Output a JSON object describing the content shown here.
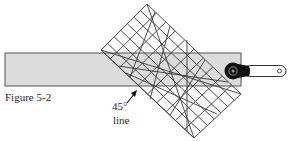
{
  "figure": {
    "caption": "Figure 5-2",
    "annotation": {
      "angle": "45°",
      "word": "line"
    }
  },
  "colors": {
    "fabric_fill": "#dcdcdc",
    "fabric_stroke": "#555555",
    "ruler_stroke": "#3a3a3a",
    "cutter_blade": "#111111",
    "handle_fill": "#ffffff",
    "handle_stroke": "#333333"
  },
  "elements": {
    "fabric_strip": "fabric strip",
    "ruler": "square ruler rotated 45 degrees with grid",
    "cutter": "rotary cutter",
    "arrow": "pointer arrow to 45-degree line"
  }
}
